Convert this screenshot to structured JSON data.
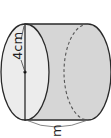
{
  "diagram": {
    "type": "cylinder",
    "orientation": "horizontal",
    "labels": {
      "radius": "4cm",
      "bottom": "m"
    },
    "colors": {
      "stroke": "#2a2a2a",
      "body_fill": "#d6d6d6",
      "face_fill": "#ececec",
      "background": "#ffffff"
    }
  }
}
